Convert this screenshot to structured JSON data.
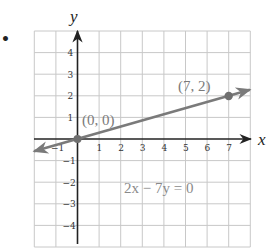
{
  "chart_data": {
    "type": "line",
    "title": "",
    "xlabel": "x",
    "ylabel": "y",
    "xlim": [
      -2,
      8
    ],
    "ylim": [
      -5,
      5
    ],
    "grid": true,
    "x_tick_labels": [
      "-1",
      "1",
      "2",
      "3",
      "4",
      "5",
      "6",
      "7"
    ],
    "y_tick_labels": [
      "4",
      "3",
      "2",
      "1",
      "-1",
      "-2",
      "-3",
      "-4"
    ],
    "series": [
      {
        "name": "2x - 7y = 0",
        "x": [
          -2,
          8
        ],
        "y": [
          -0.571,
          2.286
        ],
        "color": "#7a7a7a",
        "marked_points": [
          {
            "x": 0,
            "y": 0,
            "label": "(0, 0)"
          },
          {
            "x": 7,
            "y": 2,
            "label": "(7, 2)"
          }
        ]
      }
    ],
    "annotations": [
      {
        "text": "2x − 7y = 0",
        "x": 4.5,
        "y": -2.6
      }
    ]
  },
  "figure": {
    "bullet": "•",
    "x_axis_label": "x",
    "y_axis_label": "y",
    "point_labels": [
      "(0, 0)",
      "(7, 2)"
    ],
    "equation_label": "2x − 7y = 0",
    "colors": {
      "grid": "#c8c8c8",
      "axis": "#222222",
      "line": "#7a7a7a",
      "label_text": "#7a7a7a"
    }
  }
}
